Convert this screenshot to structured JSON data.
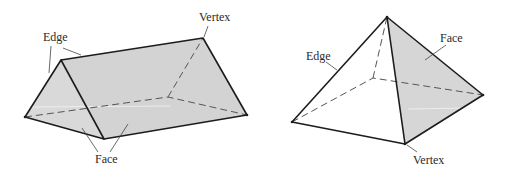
{
  "figure": {
    "colors": {
      "face_fill": "#d6d6d6",
      "face_fill_light": "#ffffff",
      "edge": "#1c1c1c",
      "hidden_edge": "#555555",
      "label": "#2a2a2a"
    },
    "prism": {
      "name": "Triangular prism",
      "labels": {
        "edge": "Edge",
        "vertex": "Vertex",
        "face": "Face"
      }
    },
    "pyramid": {
      "name": "Square pyramid",
      "labels": {
        "edge": "Edge",
        "face": "Face",
        "vertex": "Vertex"
      }
    }
  }
}
